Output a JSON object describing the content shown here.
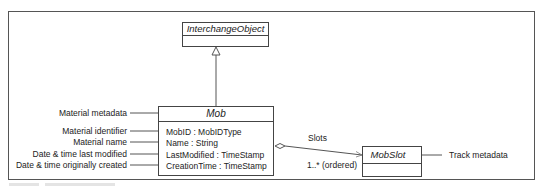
{
  "diagram": {
    "type": "UML class diagram",
    "classes": {
      "interchange_object": {
        "name": "InterchangeObject"
      },
      "mob": {
        "name": "Mob",
        "attributes": [
          "MobID : MobIDType",
          "Name : String",
          "LastModified : TimeStamp",
          "CreationTime : TimeStamp"
        ]
      },
      "mob_slot": {
        "name": "MobSlot"
      }
    },
    "annotations": {
      "mob_header": "Material metadata",
      "attributes": [
        "Material identifier",
        "Material name",
        "Date & time last modified",
        "Date & time originally created"
      ],
      "mob_slot": "Track metadata"
    },
    "association": {
      "role": "Slots",
      "multiplicity": "1..* (ordered)"
    },
    "relationships": [
      {
        "from": "Mob",
        "to": "InterchangeObject",
        "kind": "generalization"
      },
      {
        "from": "Mob",
        "to": "MobSlot",
        "kind": "aggregation"
      }
    ]
  }
}
